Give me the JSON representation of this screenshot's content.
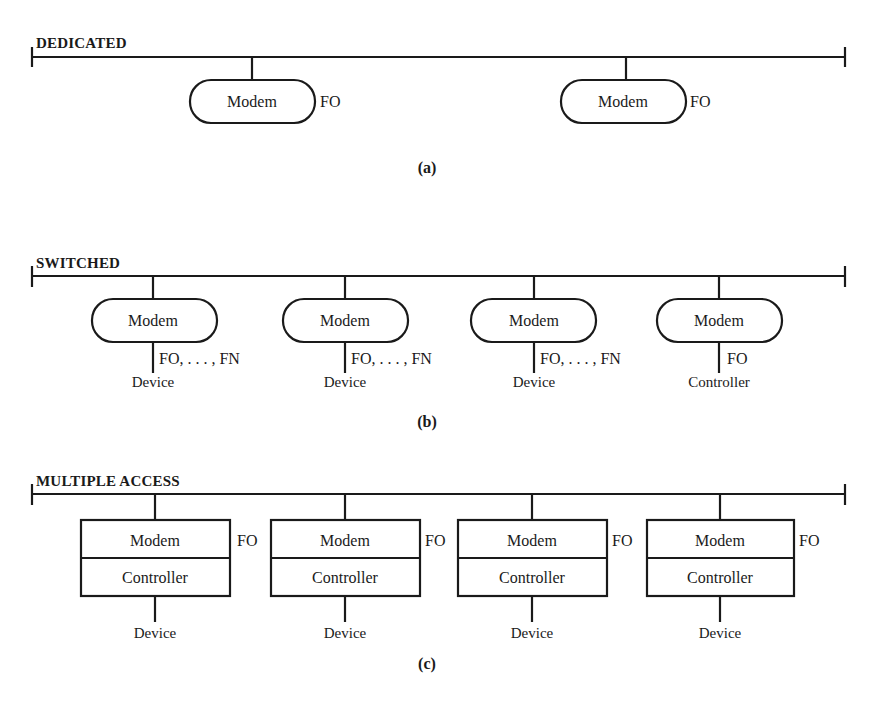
{
  "figure": {
    "panels": [
      {
        "id": "a",
        "title": "DEDICATED",
        "caption": "(a)",
        "nodes": [
          {
            "box": "Modem",
            "label": "FO"
          },
          {
            "box": "Modem",
            "label": "FO"
          }
        ]
      },
      {
        "id": "b",
        "title": "SWITCHED",
        "caption": "(b)",
        "nodes": [
          {
            "box": "Modem",
            "label": "FO, . . . , FN",
            "endpoint": "Device"
          },
          {
            "box": "Modem",
            "label": "FO, . . . , FN",
            "endpoint": "Device"
          },
          {
            "box": "Modem",
            "label": "FO, . . . , FN",
            "endpoint": "Device"
          },
          {
            "box": "Modem",
            "label": "FO",
            "endpoint": "Controller"
          }
        ]
      },
      {
        "id": "c",
        "title": "MULTIPLE ACCESS",
        "caption": "(c)",
        "nodes": [
          {
            "box_top": "Modem",
            "box_bottom": "Controller",
            "label": "FO",
            "endpoint": "Device"
          },
          {
            "box_top": "Modem",
            "box_bottom": "Controller",
            "label": "FO",
            "endpoint": "Device"
          },
          {
            "box_top": "Modem",
            "box_bottom": "Controller",
            "label": "FO",
            "endpoint": "Device"
          },
          {
            "box_top": "Modem",
            "box_bottom": "Controller",
            "label": "FO",
            "endpoint": "Device"
          }
        ]
      }
    ],
    "colors": {
      "ink": "#1a1a1a",
      "background": "#ffffff"
    }
  }
}
